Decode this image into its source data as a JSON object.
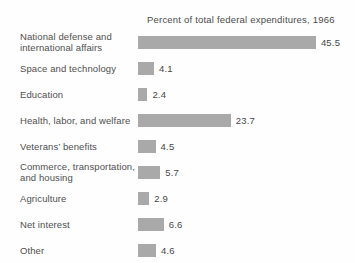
{
  "chart_data": {
    "type": "bar",
    "orientation": "horizontal",
    "title": "Percent of total federal expenditures, 1966",
    "categories": [
      "National defense and international affairs",
      "Space and technology",
      "Education",
      "Health, labor, and welfare",
      "Veterans’ benefits",
      "Commerce, transportation, and housing",
      "Agriculture",
      "Net interest",
      "Other"
    ],
    "label_lines": [
      [
        "National defense and",
        "international affairs"
      ],
      [
        "Space and technology"
      ],
      [
        "Education"
      ],
      [
        "Health, labor, and welfare"
      ],
      [
        "Veterans’ benefits"
      ],
      [
        "Commerce, transportation,",
        "and housing"
      ],
      [
        "Agriculture"
      ],
      [
        "Net interest"
      ],
      [
        "Other"
      ]
    ],
    "values": [
      45.5,
      4.1,
      2.4,
      23.7,
      4.5,
      5.7,
      2.9,
      6.6,
      4.6
    ],
    "value_labels": [
      "45.5",
      "4.1",
      "2.4",
      "23.7",
      "4.5",
      "5.7",
      "2.9",
      "6.6",
      "4.6"
    ],
    "bar_color": "#a9a9a9",
    "text_color": "#4d4d4d",
    "background_color": "#fefefe",
    "xlim": [
      0,
      50
    ],
    "grid": false,
    "legend": "none",
    "data_labels": "end-of-bar"
  }
}
